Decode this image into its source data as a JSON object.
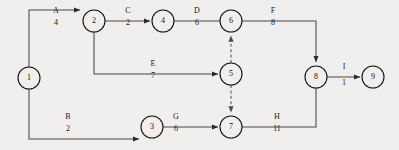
{
  "diagram": {
    "type": "aoa-network",
    "background_color": "#f1efed",
    "line_color": "#4a4744",
    "node_stroke_color": "#15120f",
    "text_color": "#1a1714"
  },
  "nodes": [
    {
      "id": "1",
      "label": "1",
      "x": 29,
      "y": 78,
      "r": 11
    },
    {
      "id": "2",
      "label": "2",
      "x": 94,
      "y": 21,
      "r": 11
    },
    {
      "id": "3",
      "label": "3",
      "x": 152,
      "y": 127,
      "r": 11
    },
    {
      "id": "4",
      "label": "4",
      "x": 163,
      "y": 21,
      "r": 11
    },
    {
      "id": "5",
      "label": "5",
      "x": 231,
      "y": 74,
      "r": 11
    },
    {
      "id": "6",
      "label": "6",
      "x": 231,
      "y": 21,
      "r": 11
    },
    {
      "id": "7",
      "label": "7",
      "x": 231,
      "y": 127,
      "r": 11
    },
    {
      "id": "8",
      "label": "8",
      "x": 316,
      "y": 77,
      "r": 11
    },
    {
      "id": "9",
      "label": "9",
      "x": 373,
      "y": 77,
      "r": 11
    }
  ],
  "edges": [
    {
      "id": "A",
      "name": "A",
      "duration": "4",
      "from": "1",
      "to": "2",
      "style": "solid",
      "label_x": 56,
      "name_y": 13,
      "dur_y": 25,
      "path": "M 29 67 L 29 10 L 80 10",
      "arrow_at": [
        81,
        10
      ],
      "arrow_dir": "right"
    },
    {
      "id": "C",
      "name": "C",
      "duration": "2",
      "from": "2",
      "to": "4",
      "style": "solid",
      "label_x": 128,
      "name_y": 13,
      "dur_y": 25,
      "path": "M 105 21 L 150 21",
      "arrow_at": [
        151,
        21
      ],
      "arrow_dir": "right"
    },
    {
      "id": "D",
      "name": "D",
      "duration": "6",
      "from": "4",
      "to": "6",
      "style": "solid",
      "label_x": 197,
      "name_y": 13,
      "dur_y": 25,
      "path": "M 174 21 L 220 21",
      "arrow_at": [
        220,
        21
      ],
      "arrow_dir": "none"
    },
    {
      "id": "F",
      "name": "F",
      "duration": "8",
      "from": "6",
      "to": "8",
      "style": "solid",
      "label_x": 273,
      "name_y": 13,
      "dur_y": 25,
      "path": "M 242 21 L 316 21 L 316 62",
      "arrow_at": [
        316,
        63
      ],
      "arrow_dir": "down"
    },
    {
      "id": "E",
      "name": "E",
      "duration": "7",
      "from": "2",
      "to": "5",
      "style": "solid",
      "label_x": 153,
      "name_y": 66,
      "dur_y": 78,
      "path": "M 94 32 L 94 74 L 218 74",
      "arrow_at": [
        219,
        74
      ],
      "arrow_dir": "right"
    },
    {
      "id": "B",
      "name": "B",
      "duration": "2",
      "from": "1",
      "to": "3",
      "style": "solid",
      "label_x": 68,
      "name_y": 119,
      "dur_y": 131,
      "path": "M 29 89 L 29 139 L 139 139",
      "arrow_at": [
        139,
        139
      ],
      "arrow_dir": "right",
      "note": "runs along lower rail then arrow into node 3"
    },
    {
      "id": "G",
      "name": "G",
      "duration": "6",
      "from": "3",
      "to": "7",
      "style": "solid",
      "label_x": 176,
      "name_y": 119,
      "dur_y": 131,
      "path": "M 163 127 L 218 127",
      "arrow_at": [
        219,
        127
      ],
      "arrow_dir": "right"
    },
    {
      "id": "H",
      "name": "H",
      "duration": "11",
      "from": "7",
      "to": "8",
      "style": "solid",
      "label_x": 277,
      "name_y": 119,
      "dur_y": 131,
      "path": "M 242 127 L 316 127 L 316 88",
      "arrow_at": [
        316,
        88
      ],
      "arrow_dir": "none"
    },
    {
      "id": "I",
      "name": "I",
      "duration": "1",
      "from": "8",
      "to": "9",
      "style": "solid",
      "label_x": 344,
      "name_y": 69,
      "dur_y": 85,
      "path": "M 327 77 L 360 77",
      "arrow_at": [
        361,
        77
      ],
      "arrow_dir": "right"
    },
    {
      "id": "dummy-5-6",
      "name": "",
      "duration": "",
      "from": "5",
      "to": "6",
      "style": "dashed",
      "label_x": 0,
      "name_y": 0,
      "dur_y": 0,
      "path": "M 231 63 L 231 36",
      "arrow_at": [
        231,
        34
      ],
      "arrow_dir": "up"
    },
    {
      "id": "dummy-5-7",
      "name": "",
      "duration": "",
      "from": "5",
      "to": "7",
      "style": "dashed",
      "label_x": 0,
      "name_y": 0,
      "dur_y": 0,
      "path": "M 231 85 L 231 112",
      "arrow_at": [
        231,
        114
      ],
      "arrow_dir": "down"
    }
  ],
  "chart_data": {
    "type": "diagram",
    "nodes": [
      "1",
      "2",
      "3",
      "4",
      "5",
      "6",
      "7",
      "8",
      "9"
    ],
    "activities": [
      {
        "name": "A",
        "duration": 4,
        "from": "1",
        "to": "2",
        "dummy": false
      },
      {
        "name": "B",
        "duration": 2,
        "from": "1",
        "to": "3",
        "dummy": false
      },
      {
        "name": "C",
        "duration": 2,
        "from": "2",
        "to": "4",
        "dummy": false
      },
      {
        "name": "D",
        "duration": 6,
        "from": "4",
        "to": "6",
        "dummy": false
      },
      {
        "name": "E",
        "duration": 7,
        "from": "2",
        "to": "5",
        "dummy": false
      },
      {
        "name": "F",
        "duration": 8,
        "from": "6",
        "to": "8",
        "dummy": false
      },
      {
        "name": "G",
        "duration": 6,
        "from": "3",
        "to": "7",
        "dummy": false
      },
      {
        "name": "H",
        "duration": 11,
        "from": "7",
        "to": "8",
        "dummy": false
      },
      {
        "name": "I",
        "duration": 1,
        "from": "8",
        "to": "9",
        "dummy": false
      },
      {
        "name": "",
        "duration": 0,
        "from": "5",
        "to": "6",
        "dummy": true
      },
      {
        "name": "",
        "duration": 0,
        "from": "5",
        "to": "7",
        "dummy": true
      }
    ],
    "legend": [],
    "xlabel": "",
    "ylabel": ""
  }
}
